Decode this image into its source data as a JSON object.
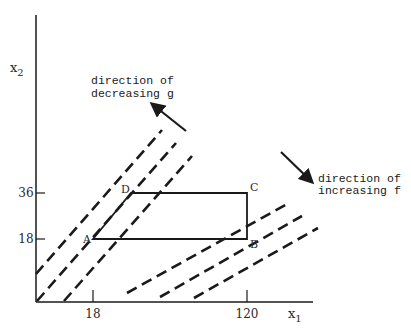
{
  "axes": {
    "x_label": "x",
    "x_label_sub": "1",
    "y_label": "x",
    "y_label_sub": "2",
    "x_ticks": [
      "18",
      "120"
    ],
    "y_ticks": [
      "36",
      "18"
    ]
  },
  "vertices": {
    "A": "A",
    "B": "B",
    "C": "C",
    "D": "D"
  },
  "annotations": {
    "g_line1": "direction of",
    "g_line2": "decreasing g",
    "f_line1": "direction of",
    "f_line2": "increasing f"
  },
  "colors": {
    "ink": "#1a1a1a",
    "background": "#ffffff"
  }
}
